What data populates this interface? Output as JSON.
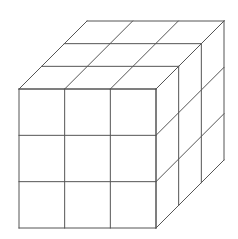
{
  "figure": {
    "type": "cube-line-drawing",
    "grid_divisions": 3,
    "line_color": "#555555",
    "background_color": "#ffffff",
    "front_face": {
      "x0": 19,
      "y0": 89,
      "x1": 156,
      "y1": 228
    },
    "depth_offset": {
      "dx": 68,
      "dy": -68
    }
  }
}
